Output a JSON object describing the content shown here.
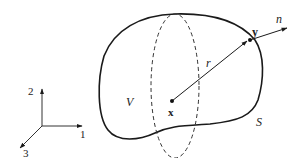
{
  "diagram": {
    "labels": {
      "region": "V",
      "surface": "S",
      "interior_point": "x",
      "boundary_point": "y",
      "distance": "r",
      "normal": "n"
    },
    "axes": {
      "axis1": "1",
      "axis2": "2",
      "axis3": "3"
    },
    "colors": {
      "stroke": "#1a1a1a",
      "background": "#ffffff"
    }
  }
}
